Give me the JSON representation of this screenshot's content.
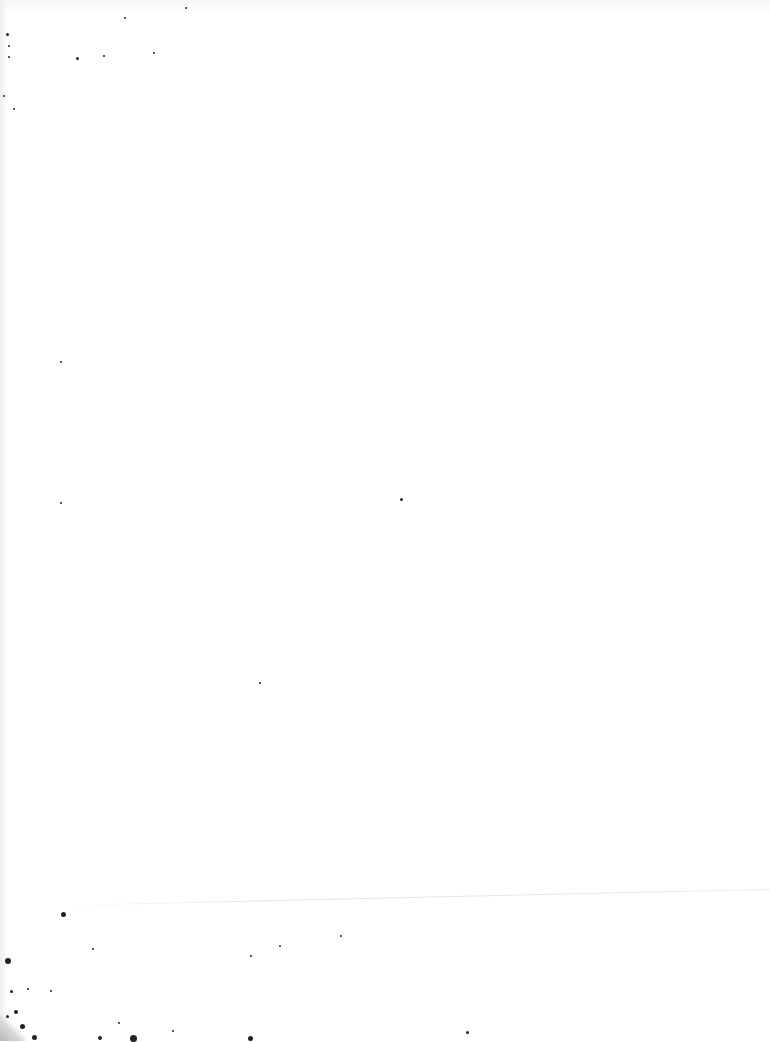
{
  "page": {
    "type": "blank-scanned-page",
    "background": "#ffffff",
    "text_content": "",
    "speck_color": "#222222"
  },
  "specks": [
    [
      185,
      7,
      2
    ],
    [
      124,
      17,
      2
    ],
    [
      76,
      57,
      3
    ],
    [
      153,
      52,
      2
    ],
    [
      103,
      55,
      2
    ],
    [
      6,
      33,
      3
    ],
    [
      8,
      45,
      2
    ],
    [
      8,
      56,
      2
    ],
    [
      3,
      95,
      2
    ],
    [
      13,
      108,
      2
    ],
    [
      400,
      498,
      3
    ],
    [
      259,
      682,
      2
    ],
    [
      60,
      361,
      2
    ],
    [
      60,
      502,
      2
    ],
    [
      61,
      912,
      5
    ],
    [
      5,
      958,
      6
    ],
    [
      10,
      990,
      3
    ],
    [
      14,
      1010,
      4
    ],
    [
      6,
      1015,
      3
    ],
    [
      20,
      1024,
      5
    ],
    [
      32,
      1035,
      5
    ],
    [
      98,
      1036,
      4
    ],
    [
      130,
      1035,
      7
    ],
    [
      248,
      1036,
      5
    ],
    [
      466,
      1031,
      3
    ],
    [
      92,
      948,
      2
    ],
    [
      27,
      988,
      2
    ],
    [
      50,
      990,
      2
    ],
    [
      118,
      1022,
      2
    ],
    [
      172,
      1030,
      2
    ],
    [
      340,
      935,
      2
    ],
    [
      250,
      955,
      2
    ],
    [
      279,
      945,
      2
    ]
  ]
}
